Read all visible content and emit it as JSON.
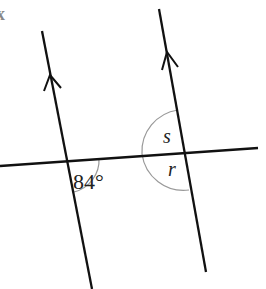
{
  "diagram": {
    "type": "parallel-lines-transversal",
    "corner_label": "x",
    "angles": [
      {
        "id": "given",
        "label": "84°",
        "position": "below transversal, right of left parallel line"
      },
      {
        "id": "s",
        "label": "s",
        "position": "above transversal, left of right parallel line"
      },
      {
        "id": "r",
        "label": "r",
        "position": "below transversal, left of right parallel line"
      }
    ],
    "lines": {
      "parallel_left": "line with arrow marking",
      "parallel_right": "line with arrow marking",
      "transversal": "line crossing both parallel lines"
    },
    "colors": {
      "line": "#111111",
      "arc": "#999999"
    }
  }
}
